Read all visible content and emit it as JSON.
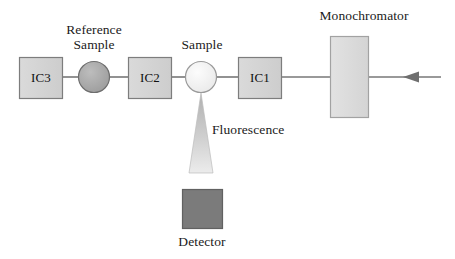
{
  "diagram": {
    "background_color": "#ffffff",
    "stroke_color": "#707070",
    "text_color": "#1a1a1a",
    "beam_line": {
      "y": 77,
      "x_start": 62,
      "x_end": 441,
      "direction": "right-to-left",
      "arrow_tip_x": 403,
      "arrow_tail_x": 441
    },
    "components": [
      {
        "id": "ic3",
        "kind": "box",
        "label": "IC3",
        "fill": "#d4d4d4",
        "stroke": "#7d7d7d",
        "x": 19,
        "y": 57,
        "width": 44,
        "height": 42
      },
      {
        "id": "reference-sample",
        "kind": "circle",
        "label": "Reference\nSample",
        "label_line_1": "Reference",
        "label_line_2": "Sample",
        "fill": "#ababab",
        "stroke": "#6e6e6e",
        "cx": 94,
        "cy": 77,
        "r": 16
      },
      {
        "id": "ic2",
        "kind": "box",
        "label": "IC2",
        "fill": "#d4d4d4",
        "stroke": "#7d7d7d",
        "x": 128,
        "y": 57,
        "width": 44,
        "height": 42
      },
      {
        "id": "sample",
        "kind": "circle",
        "label": "Sample",
        "fill": "#f3f3f3",
        "stroke": "#9a9a9a",
        "cx": 201,
        "cy": 77,
        "r": 16
      },
      {
        "id": "ic1",
        "kind": "box",
        "label": "IC1",
        "fill": "#d4d4d4",
        "stroke": "#7d7d7d",
        "x": 238,
        "y": 57,
        "width": 44,
        "height": 42
      },
      {
        "id": "monochromator",
        "kind": "box",
        "label": "Monochromator",
        "fill": "#dcdcdc",
        "stroke": "#9e9e9e",
        "x": 330,
        "y": 36,
        "width": 39,
        "height": 82
      },
      {
        "id": "fluorescence-cone",
        "kind": "triangle",
        "label": "Fluorescence",
        "fill_top": "#b8b8b8",
        "fill_bottom": "#e8e8e8",
        "apex_x": 201,
        "apex_y": 94,
        "base_y": 173,
        "base_half_width": 12
      },
      {
        "id": "detector",
        "kind": "box",
        "label": "Detector",
        "fill": "#7b7b7b",
        "stroke": "#5d5d5d",
        "x": 182,
        "y": 189,
        "width": 41,
        "height": 40
      }
    ],
    "labels": {
      "reference_sample_line1": "Reference",
      "reference_sample_line2": "Sample",
      "sample": "Sample",
      "monochromator": "Monochromator",
      "fluorescence": "Fluorescence",
      "detector": "Detector",
      "ic1": "IC1",
      "ic2": "IC2",
      "ic3": "IC3"
    }
  }
}
